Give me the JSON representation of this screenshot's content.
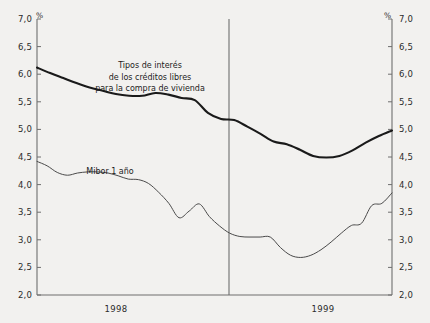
{
  "figure": {
    "background_color": "#f2f1ef",
    "axis_color": "#6e6e6e",
    "text_color": "#2b2b2b"
  },
  "axes": {
    "unit_symbol_left": "%",
    "unit_symbol_right": "%",
    "y_ticks": [
      "7,0",
      "6,5",
      "6,0",
      "5,5",
      "5,0",
      "4,5",
      "4,0",
      "3,5",
      "3,0",
      "2,5",
      "2,0"
    ],
    "x_period_labels": [
      "1998",
      "1999"
    ]
  },
  "annotations": {
    "series1_line1": "Tipos de interés",
    "series1_line2": "de los créditos libres",
    "series1_line3": "para la compra de vivienda",
    "series2": "Mibor 1 año"
  },
  "chart_data": {
    "type": "line",
    "title": "",
    "subtitle": "",
    "xlabel": "",
    "ylabel": "%",
    "ylim": [
      2.0,
      7.0
    ],
    "ytick_step": 0.5,
    "grid": false,
    "legend_position": "inline-annotation",
    "x": [
      "1998-01",
      "1998-02",
      "1998-03",
      "1998-04",
      "1998-05",
      "1998-06",
      "1998-07",
      "1998-08",
      "1998-09",
      "1998-10",
      "1998-11",
      "1998-12",
      "1999-01",
      "1999-02",
      "1999-03",
      "1999-04",
      "1999-05",
      "1999-06",
      "1999-07",
      "1999-08",
      "1999-09",
      "1999-10",
      "1999-11",
      "1999-12"
    ],
    "x_tick_labels": [
      "1998",
      "1999"
    ],
    "series": [
      {
        "name": "Tipos de interés de los créditos libres para la compra de vivienda",
        "line_color": "#1a1a1a",
        "line_width": 2.1,
        "values": [
          6.12,
          6.02,
          5.93,
          5.84,
          5.76,
          5.7,
          5.64,
          5.61,
          5.61,
          5.66,
          5.63,
          5.57,
          5.53,
          5.3,
          5.19,
          5.17,
          5.05,
          4.92,
          4.78,
          4.73,
          4.63,
          4.52,
          4.49,
          4.52
        ],
        "values_tail": [
          4.62,
          4.76,
          4.88,
          4.98
        ]
      },
      {
        "name": "Mibor 1 año",
        "line_color": "#4a4a4a",
        "line_width": 1.0,
        "values": [
          4.42,
          4.34,
          4.22,
          4.17,
          4.21,
          4.23,
          4.23,
          4.21,
          4.16,
          4.1,
          4.09,
          4.02,
          3.86,
          3.66,
          3.4,
          3.52,
          3.65,
          3.42,
          3.25,
          3.12,
          3.06,
          3.05,
          3.05,
          3.05
        ],
        "values_tail": [
          2.86,
          2.72,
          2.68,
          2.72,
          2.82,
          2.96,
          3.12,
          3.26,
          3.3,
          3.62,
          3.66,
          3.85
        ]
      }
    ]
  }
}
